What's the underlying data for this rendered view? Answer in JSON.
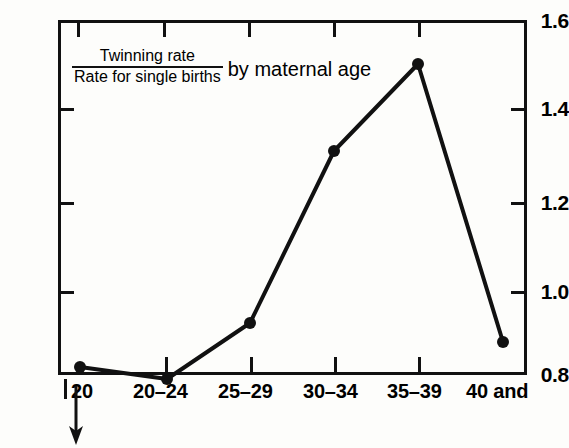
{
  "chart_data": {
    "type": "line",
    "title_numerator": "Twinning rate",
    "title_denominator": "Rate for single births",
    "title_suffix": "by maternal age",
    "xlabel": "",
    "ylabel": "",
    "categories": [
      "20",
      "20–24",
      "25–29",
      "30–34",
      "35–39",
      "40 and"
    ],
    "values": [
      0.82,
      0.78,
      0.92,
      1.32,
      1.51,
      0.88
    ],
    "ylim": [
      0.8,
      1.6
    ],
    "ytick_labels": [
      "0.8",
      "1.0",
      "1.2",
      "1.4",
      "1.6"
    ],
    "ytick_values": [
      0.8,
      1.0,
      1.2,
      1.4,
      1.6
    ],
    "grid": false,
    "legend": "none",
    "marker": "filled-circle",
    "line_color": "#111111",
    "marker_color": "#111111",
    "background_color": "#fdfdfb"
  },
  "axis": {
    "y_labels": [
      {
        "text": "1.6",
        "top": 10
      },
      {
        "text": "1.4",
        "top": 98
      },
      {
        "text": "1.2",
        "top": 192
      },
      {
        "text": "1.0",
        "top": 281
      },
      {
        "text": "0.8",
        "top": 364
      }
    ],
    "y_ticks_left": [
      108,
      202,
      291
    ],
    "y_ticks_right": [
      108,
      202,
      291
    ],
    "x_ticks_top": [
      77,
      163,
      248,
      333,
      418
    ],
    "x_ticks_bottom": [
      165,
      250,
      334,
      418
    ],
    "x_labels": [
      {
        "text": "20",
        "left": 71
      },
      {
        "text": "20–24",
        "left": 133
      },
      {
        "text": "25–29",
        "left": 218
      },
      {
        "text": "30–34",
        "left": 303
      },
      {
        "text": "35–39",
        "left": 387
      },
      {
        "text": "40 and",
        "left": 466
      }
    ]
  },
  "annotation": {
    "under_twenty_arrow": "down-arrow"
  },
  "points": [
    {
      "label": "20",
      "value": 0.82,
      "x": 80,
      "y": 367
    },
    {
      "label": "20–24",
      "value": 0.78,
      "x": 167,
      "y": 379
    },
    {
      "label": "25–29",
      "value": 0.92,
      "x": 250,
      "y": 323
    },
    {
      "label": "30–34",
      "value": 1.32,
      "x": 334,
      "y": 151
    },
    {
      "label": "35–39",
      "value": 1.51,
      "x": 418,
      "y": 64
    },
    {
      "label": "40 and",
      "value": 0.88,
      "x": 503,
      "y": 342
    }
  ]
}
